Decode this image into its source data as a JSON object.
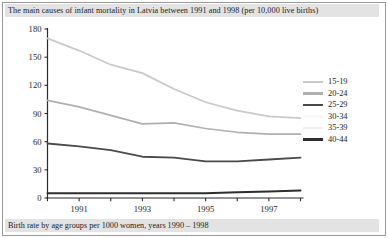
{
  "figure": {
    "title": "The main causes of infant mortality in Latvia between 1991 and 1998 (per 10,000 live births)",
    "caption": "Birth rate by age groups per 1000 women, years 1990 – 1998"
  },
  "colors": {
    "axis": "#2b2b2b",
    "text": "#1d1d1d",
    "band_background": "#e3e3e3",
    "frame": "#9a9a9a",
    "series_15_19": "#c9c9c9",
    "series_20_24": "#b0b0b0",
    "series_25_29": "#4a4a4a",
    "series_30_34": "#f2f2f2",
    "series_35_39": "#ececec",
    "series_40_44": "#2e2e2e"
  },
  "chart_data": {
    "type": "line",
    "title": "The main causes of infant mortality in Latvia between 1991 and 1998 (per 10,000 live births)",
    "xlabel": "",
    "ylabel": "",
    "x": [
      1990,
      1991,
      1992,
      1993,
      1994,
      1995,
      1996,
      1997,
      1998
    ],
    "xtick_labels": [
      "1991",
      "1993",
      "1995",
      "1997"
    ],
    "xtick_values": [
      1991,
      1993,
      1995,
      1997
    ],
    "ytick_labels": [
      "0",
      "30",
      "60",
      "90",
      "120",
      "150",
      "180"
    ],
    "ytick_values": [
      0,
      30,
      60,
      90,
      120,
      150,
      180
    ],
    "xlim": [
      1990,
      1998
    ],
    "ylim": [
      0,
      180
    ],
    "grid": false,
    "legend_position": "right",
    "series": [
      {
        "name": "15-19",
        "color": "#c9c9c9",
        "values": [
          170,
          157,
          142,
          133,
          116,
          102,
          93,
          87,
          85
        ]
      },
      {
        "name": "20-24",
        "color": "#b0b0b0",
        "values": [
          104,
          97,
          88,
          79,
          80,
          74,
          70,
          68,
          68
        ]
      },
      {
        "name": "25-29",
        "color": "#4a4a4a",
        "values": [
          58,
          55,
          51,
          44,
          43,
          39,
          39,
          41,
          43
        ]
      },
      {
        "name": "30-34",
        "color": "#f2f2f2",
        "values": [
          null,
          null,
          null,
          null,
          null,
          null,
          null,
          null,
          null
        ]
      },
      {
        "name": "35-39",
        "color": "#ececec",
        "values": [
          null,
          null,
          null,
          null,
          null,
          null,
          null,
          null,
          null
        ]
      },
      {
        "name": "40-44",
        "color": "#2e2e2e",
        "values": [
          5,
          5,
          5,
          5,
          5,
          5,
          6,
          7,
          8
        ]
      }
    ]
  },
  "legend": {
    "items": [
      {
        "label": "15-19",
        "color": "#c9c9c9"
      },
      {
        "label": "20-24",
        "color": "#b0b0b0"
      },
      {
        "label": "25-29",
        "color": "#4a4a4a"
      },
      {
        "label": "30-34",
        "color": "#f7f7f7"
      },
      {
        "label": "35-39",
        "color": "#f2f2f2"
      },
      {
        "label": "40-44",
        "color": "#2e2e2e"
      }
    ]
  }
}
